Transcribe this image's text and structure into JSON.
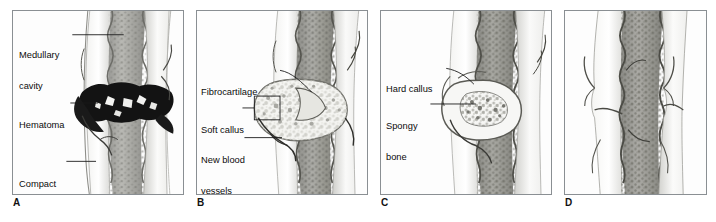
{
  "figure": {
    "type": "medical-illustration",
    "panel_count": 4,
    "background_color": "#ffffff",
    "frame_color": "#8a8f93",
    "label_color": "#0b0b0b",
    "leader_line_color": "#1a1a1a"
  },
  "panels": [
    {
      "letter": "A",
      "name": "hematoma-formation",
      "labels": [
        {
          "id": "medullary-cavity",
          "text": "Medullary\ncavity",
          "line1": "Medullary",
          "line2": "cavity"
        },
        {
          "id": "hematoma",
          "text": "Hematoma",
          "line1": "Hematoma",
          "line2": ""
        },
        {
          "id": "compact-bone",
          "text": "Compact\nbone",
          "line1": "Compact",
          "line2": "bone"
        }
      ]
    },
    {
      "letter": "B",
      "name": "soft-callus-formation",
      "labels": [
        {
          "id": "fibrocartilage",
          "text": "Fibrocartilage",
          "line1": "Fibrocartilage",
          "line2": ""
        },
        {
          "id": "soft-callus",
          "text": "Soft callus",
          "line1": "Soft callus",
          "line2": ""
        },
        {
          "id": "new-blood-vessels",
          "text": "New blood\nvessels",
          "line1": "New blood",
          "line2": "vessels"
        }
      ]
    },
    {
      "letter": "C",
      "name": "hard-callus-formation",
      "labels": [
        {
          "id": "hard-callus",
          "text": "Hard callus",
          "line1": "Hard callus",
          "line2": ""
        },
        {
          "id": "spongy-bone",
          "text": "Spongy\nbone",
          "line1": "Spongy",
          "line2": "bone"
        }
      ]
    },
    {
      "letter": "D",
      "name": "bone-remodeling",
      "labels": []
    }
  ],
  "bottom_caption": {
    "text": "",
    "note": "cut-off caption line at image bottom edge, not legible"
  }
}
